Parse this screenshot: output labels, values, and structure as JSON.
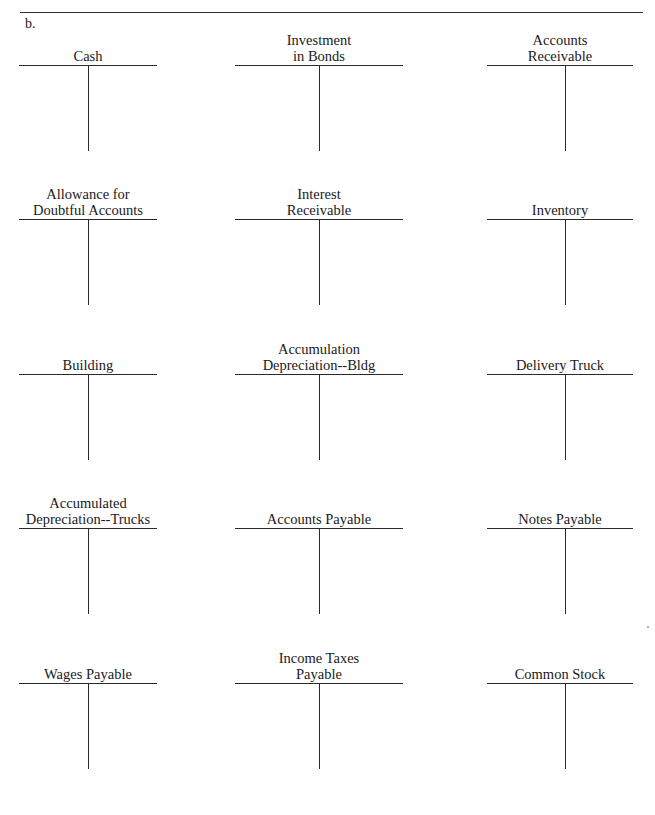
{
  "document": {
    "part_label": "b.",
    "accounts": [
      {
        "id": "cash",
        "title_lines": [
          "Cash"
        ]
      },
      {
        "id": "investment-in-bonds",
        "title_lines": [
          "Investment",
          "in Bonds"
        ]
      },
      {
        "id": "accounts-receivable",
        "title_lines": [
          "Accounts",
          "Receivable"
        ]
      },
      {
        "id": "allowance-doubtful-accounts",
        "title_lines": [
          "Allowance for",
          "Doubtful Accounts"
        ]
      },
      {
        "id": "interest-receivable",
        "title_lines": [
          "Interest",
          "Receivable"
        ]
      },
      {
        "id": "inventory",
        "title_lines": [
          "Inventory"
        ]
      },
      {
        "id": "building",
        "title_lines": [
          "Building"
        ]
      },
      {
        "id": "accumulation-depreciation-bldg",
        "title_lines": [
          "Accumulation",
          "Depreciation--Bldg"
        ]
      },
      {
        "id": "delivery-truck",
        "title_lines": [
          "Delivery Truck"
        ]
      },
      {
        "id": "accumulated-depreciation-trucks",
        "title_lines": [
          "Accumulated",
          "Depreciation--Trucks"
        ]
      },
      {
        "id": "accounts-payable",
        "title_lines": [
          "Accounts Payable"
        ]
      },
      {
        "id": "notes-payable",
        "title_lines": [
          "Notes Payable"
        ]
      },
      {
        "id": "wages-payable",
        "title_lines": [
          "Wages Payable"
        ]
      },
      {
        "id": "income-taxes-payable",
        "title_lines": [
          "Income Taxes",
          "Payable"
        ]
      },
      {
        "id": "common-stock",
        "title_lines": [
          "Common Stock"
        ]
      }
    ]
  }
}
